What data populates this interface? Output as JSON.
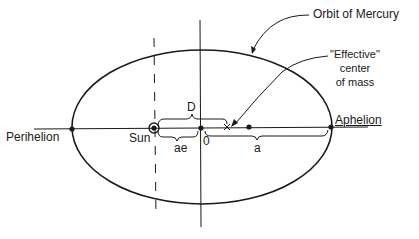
{
  "diagram": {
    "title_label": "Orbit of Mercury",
    "effective_center_label": [
      "\"Effective\"",
      "center",
      "of mass"
    ],
    "perihelion_label": "Perihelion",
    "aphelion_label": "Aphelion",
    "sun_label": "Sun",
    "origin_label": "0",
    "distance_D_label": "D",
    "distance_ae_label": "ae",
    "semi_major_a_label": "a",
    "colors": {
      "ink": "#1a1a1a",
      "background": "#ffffff"
    }
  }
}
